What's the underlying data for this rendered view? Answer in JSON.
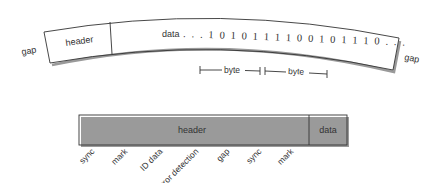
{
  "track_diagram": {
    "left_gap_label": "gap",
    "right_gap_label": "gap",
    "header_label": "header",
    "data_label": "data",
    "data_bits": ". . . 1 0 1 0 1 1 1 1 0 0 1 0 1 1 1 0 . . .",
    "byte_labels": [
      "byte",
      "byte"
    ]
  },
  "sector_diagram": {
    "header_label": "header",
    "data_label": "data",
    "field_labels": [
      "sync",
      "mark",
      "ID data",
      "error detection",
      "gap",
      "sync",
      "mark"
    ]
  },
  "colors": {
    "line": "#333333",
    "shadow": "#9a9a9a",
    "background": "#ffffff"
  }
}
